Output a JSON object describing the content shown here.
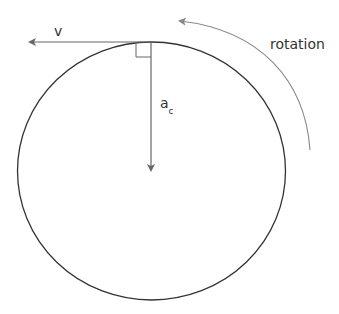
{
  "diagram": {
    "labels": {
      "velocity": "v",
      "acceleration_main": "a",
      "acceleration_sub": "c",
      "rotation": "rotation"
    },
    "colors": {
      "circle": "#333333",
      "vector": "#666666",
      "rotation_arrow": "#888888",
      "text": "#333333"
    },
    "elements": [
      {
        "type": "circle",
        "description": "circular path"
      },
      {
        "type": "arrow",
        "label": "v",
        "direction": "left",
        "meaning": "tangential velocity"
      },
      {
        "type": "arrow",
        "label": "a_c",
        "direction": "down toward center",
        "meaning": "centripetal acceleration"
      },
      {
        "type": "right-angle-marker",
        "meaning": "v perpendicular to a_c"
      },
      {
        "type": "curved-arrow",
        "label": "rotation",
        "direction": "counterclockwise"
      }
    ]
  }
}
